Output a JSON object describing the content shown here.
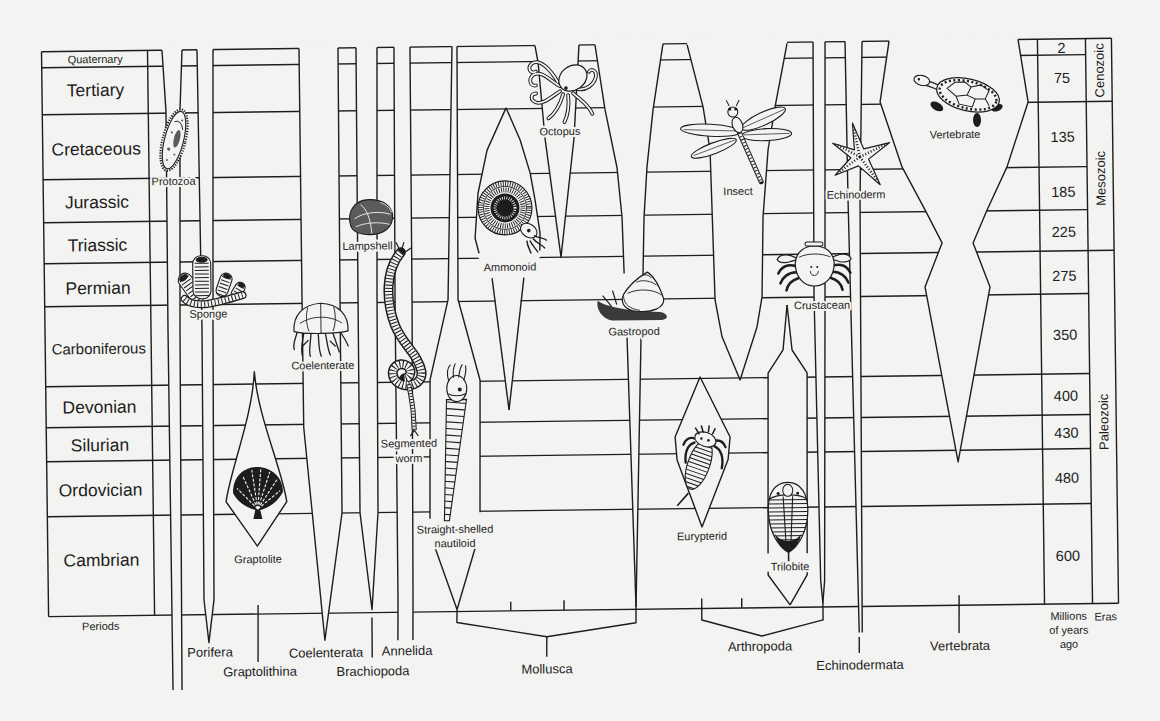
{
  "colors": {
    "paper": "#f3f3f1",
    "ink": "#1d1d1d"
  },
  "figure": {
    "periods_header": "Periods",
    "periods": [
      {
        "name": "Quaternary",
        "mya": "2"
      },
      {
        "name": "Tertiary",
        "mya": "75"
      },
      {
        "name": "Cretaceous",
        "mya": "135"
      },
      {
        "name": "Jurassic",
        "mya": "185"
      },
      {
        "name": "Triassic",
        "mya": "225"
      },
      {
        "name": "Permian",
        "mya": "275"
      },
      {
        "name": "Carboniferous",
        "mya": "350"
      },
      {
        "name": "Devonian",
        "mya": "400"
      },
      {
        "name": "Silurian",
        "mya": "430"
      },
      {
        "name": "Ordovician",
        "mya": "480"
      },
      {
        "name": "Cambrian",
        "mya": "600"
      }
    ],
    "mya_header": [
      "Millions",
      "of years",
      "ago"
    ],
    "eras_header": "Eras",
    "eras": [
      {
        "name": "Cenozoic",
        "periods": [
          "Quaternary",
          "Tertiary"
        ]
      },
      {
        "name": "Mesozoic",
        "periods": [
          "Cretaceous",
          "Jurassic",
          "Triassic"
        ]
      },
      {
        "name": "Paleozoic",
        "periods": [
          "Permian",
          "Carboniferous",
          "Devonian",
          "Silurian",
          "Ordovician",
          "Cambrian"
        ]
      }
    ],
    "phyla": [
      {
        "name": "Porifera",
        "representatives": [
          "Sponge"
        ]
      },
      {
        "name": "Graptolithina",
        "representatives": [
          "Graptolite"
        ]
      },
      {
        "name": "Coelenterata",
        "representatives": [
          "Coelenterate"
        ]
      },
      {
        "name": "Brachiopoda",
        "representatives": [
          "Lampshell"
        ]
      },
      {
        "name": "Annelida",
        "representatives": [
          "Segmented worm"
        ]
      },
      {
        "name": "Mollusca",
        "representatives": [
          "Straight-shelled nautiloid",
          "Ammonoid",
          "Octopus",
          "Gastropod"
        ]
      },
      {
        "name": "Arthropoda",
        "representatives": [
          "Insect",
          "Eurypterid",
          "Trilobite",
          "Crustacean"
        ]
      },
      {
        "name": "Echinodermata",
        "representatives": [
          "Echinoderm"
        ]
      },
      {
        "name": "Vertebrata",
        "representatives": [
          "Vertebrate"
        ]
      }
    ],
    "organisms": {
      "protozoa": "Protozoa",
      "sponge": "Sponge",
      "graptolite": "Graptolite",
      "coelenterate": "Coelenterate",
      "lampshell": "Lampshell",
      "segmented_worm": [
        "Segmented",
        "worm"
      ],
      "nautiloid": [
        "Straight-shelled",
        "nautiloid"
      ],
      "ammonoid": "Ammonoid",
      "octopus": "Octopus",
      "gastropod": "Gastropod",
      "insect": "Insect",
      "eurypterid": "Eurypterid",
      "trilobite": "Trilobite",
      "crustacean": "Crustacean",
      "echinoderm": "Echinoderm",
      "vertebrate": "Vertebrate"
    }
  }
}
